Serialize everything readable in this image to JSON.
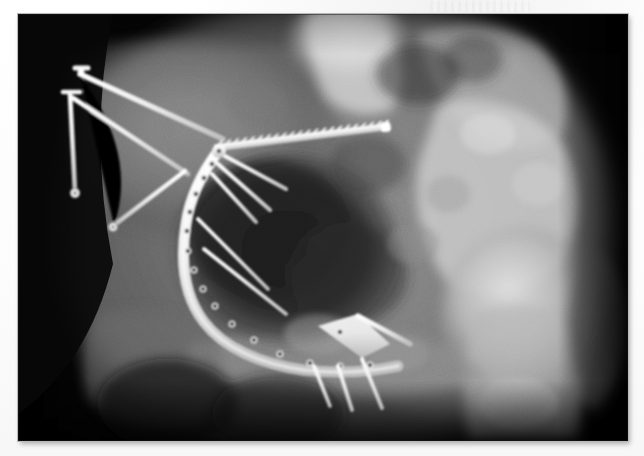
{
  "document": {
    "kind": "radiograph",
    "modality": "X-ray",
    "body_region": "Pelvis",
    "view": "Anteroposterior (AP) oblique",
    "side": "Left hemipelvis / acetabulum",
    "background_color": "#ffffff",
    "film_border_color": "#b9b9b9"
  },
  "image": {
    "x": 18,
    "y": 14,
    "width": 610,
    "height": 427,
    "base_tone": "#000000",
    "soft_tissue_tone": "#4a4a4a",
    "bone_tone": "#a8a8a8",
    "dense_bone_tone": "#dedede",
    "metal_tone": "#f2f2f2",
    "foramen_tone": "#2b2b2b"
  },
  "anatomy": [
    {
      "name": "sacrum-and-lower-lumbar-spine",
      "label": "Sacrum / lower lumbar spine",
      "position": "top-center",
      "density": "dense"
    },
    {
      "name": "left-iliac-wing",
      "label": "Left iliac wing",
      "position": "upper-left",
      "density": "moderate"
    },
    {
      "name": "acetabulum",
      "label": "Acetabulum",
      "position": "center",
      "density": "moderate"
    },
    {
      "name": "obturator-foramen",
      "label": "Obturator foramen",
      "position": "center-lower-left",
      "density": "lucent"
    },
    {
      "name": "femoral-head",
      "label": "Femoral head",
      "position": "right",
      "density": "dense"
    },
    {
      "name": "femoral-neck",
      "label": "Femoral neck",
      "position": "lower-right",
      "density": "dense"
    },
    {
      "name": "greater-trochanter",
      "label": "Greater trochanter",
      "position": "far-right",
      "density": "moderate"
    },
    {
      "name": "pubic-ramus",
      "label": "Superior pubic ramus",
      "position": "lower-center",
      "density": "moderate"
    },
    {
      "name": "ischial-tuberosity",
      "label": "Ischial tuberosity",
      "position": "bottom-left",
      "density": "moderate"
    },
    {
      "name": "sacroiliac-joint",
      "label": "Sacroiliac joint",
      "position": "upper-right-of-center",
      "density": "dense"
    }
  ],
  "hardware": [
    {
      "name": "reconstruction-plate",
      "label": "Curved pelvic reconstruction plate",
      "holes": 14,
      "path": "posterior column, arcing around acetabulum"
    },
    {
      "name": "sacroiliac-screw",
      "label": "Long threaded cancellous (iliosacral) screw",
      "orientation": "oblique, left to right across superior pelvis"
    },
    {
      "name": "external-fixator-pin-upper",
      "label": "External fixation pin (upper)",
      "head": "T-shaped"
    },
    {
      "name": "external-fixator-pin-lower",
      "label": "External fixation pin (lower)",
      "head": "T-shaped"
    },
    {
      "name": "iliac-crest-screw-long",
      "label": "Long oblique iliac screw",
      "orientation": "upper-left to center"
    },
    {
      "name": "cortical-screw-1",
      "label": "Cortical screw",
      "orientation": "oblique inferolateral"
    },
    {
      "name": "cortical-screw-2",
      "label": "Cortical screw",
      "orientation": "oblique inferolateral"
    },
    {
      "name": "cortical-screw-3",
      "label": "Cortical screw",
      "orientation": "oblique inferolateral"
    },
    {
      "name": "inferior-screw-1",
      "label": "Inferior ramus screw",
      "orientation": "downward"
    },
    {
      "name": "inferior-screw-2",
      "label": "Inferior ramus screw",
      "orientation": "downward"
    },
    {
      "name": "inferior-screw-3",
      "label": "Inferior ramus screw",
      "orientation": "downward"
    }
  ]
}
